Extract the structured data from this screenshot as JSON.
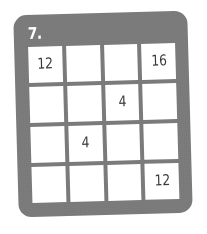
{
  "card": {
    "background_color": "#7d7d7d",
    "cell_color": "#ffffff",
    "label_color": "#ffffff",
    "digit_color": "#3a3a3a"
  },
  "problem": {
    "number_label": "7."
  },
  "grid": {
    "rows": 4,
    "columns": 4,
    "cells": [
      {
        "row": 1,
        "col": 1,
        "value": "12"
      },
      {
        "row": 1,
        "col": 2,
        "value": ""
      },
      {
        "row": 1,
        "col": 3,
        "value": ""
      },
      {
        "row": 1,
        "col": 4,
        "value": "16"
      },
      {
        "row": 2,
        "col": 1,
        "value": ""
      },
      {
        "row": 2,
        "col": 2,
        "value": ""
      },
      {
        "row": 2,
        "col": 3,
        "value": "4"
      },
      {
        "row": 2,
        "col": 4,
        "value": ""
      },
      {
        "row": 3,
        "col": 1,
        "value": ""
      },
      {
        "row": 3,
        "col": 2,
        "value": "4"
      },
      {
        "row": 3,
        "col": 3,
        "value": ""
      },
      {
        "row": 3,
        "col": 4,
        "value": ""
      },
      {
        "row": 4,
        "col": 1,
        "value": ""
      },
      {
        "row": 4,
        "col": 2,
        "value": ""
      },
      {
        "row": 4,
        "col": 3,
        "value": ""
      },
      {
        "row": 4,
        "col": 4,
        "value": "12"
      }
    ]
  }
}
